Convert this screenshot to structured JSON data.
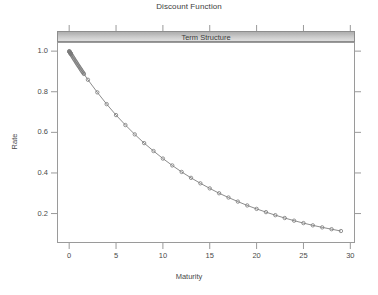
{
  "chart_data": {
    "type": "line",
    "title": "Discount Function",
    "strip_label": "Term Structure",
    "xlabel": "Maturity",
    "ylabel": "Rate",
    "xlim": [
      -1.3,
      30.5
    ],
    "ylim": [
      0.055,
      1.045
    ],
    "xticks": [
      0,
      5,
      10,
      15,
      20,
      25,
      30
    ],
    "xtick_labels": [
      "0",
      "5",
      "10",
      "15",
      "20",
      "25",
      "30"
    ],
    "yticks": [
      0.2,
      0.4,
      0.6,
      0.8,
      1.0
    ],
    "ytick_labels": [
      "0.2",
      "0.4",
      "0.6",
      "0.8",
      "1.0"
    ],
    "grid": false,
    "legend": "none",
    "marker": "open-circle",
    "line_color": "#6e6e6e",
    "marker_color": "#7a7a7a",
    "series": [
      {
        "name": "Discount Factor",
        "x": [
          0.003,
          0.019,
          0.038,
          0.058,
          0.077,
          0.096,
          0.115,
          0.134,
          0.154,
          0.173,
          0.192,
          0.25,
          0.33,
          0.42,
          0.5,
          0.58,
          0.67,
          0.75,
          0.83,
          0.92,
          1.0,
          1.08,
          1.17,
          1.25,
          1.33,
          1.42,
          1.5,
          1.58,
          2.0,
          3.0,
          4.0,
          5.0,
          6.0,
          7.0,
          8.0,
          9.0,
          10.0,
          11.0,
          12.0,
          13.0,
          14.0,
          15.0,
          16.0,
          17.0,
          18.0,
          19.0,
          20.0,
          21.0,
          22.0,
          23.0,
          24.0,
          25.0,
          26.0,
          27.0,
          28.0,
          29.0
        ],
        "y": [
          0.9998,
          0.9986,
          0.9971,
          0.9956,
          0.9942,
          0.9927,
          0.9913,
          0.9899,
          0.9884,
          0.987,
          0.9856,
          0.9813,
          0.9754,
          0.9688,
          0.963,
          0.9571,
          0.9507,
          0.9449,
          0.9391,
          0.9327,
          0.9272,
          0.9215,
          0.9153,
          0.9098,
          0.9042,
          0.8981,
          0.8927,
          0.8873,
          0.859,
          0.797,
          0.739,
          0.685,
          0.636,
          0.59,
          0.547,
          0.508,
          0.471,
          0.437,
          0.405,
          0.376,
          0.349,
          0.324,
          0.3,
          0.279,
          0.259,
          0.24,
          0.223,
          0.207,
          0.192,
          0.178,
          0.165,
          0.153,
          0.142,
          0.132,
          0.123,
          0.114
        ]
      }
    ]
  },
  "panel": {
    "left": 57,
    "top": 42,
    "width": 298,
    "height": 201
  }
}
